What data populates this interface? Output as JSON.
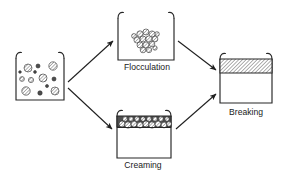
{
  "figure": {
    "name": "emulsion-instability-diagram",
    "type": "process-diagram",
    "background_color": "#ffffff",
    "line_color": "#262626",
    "label_color": "#1a1a1a",
    "width": 290,
    "height": 180
  },
  "stages": [
    {
      "id": "initial",
      "label": "",
      "label_visible": false,
      "beaker": {
        "x": 16,
        "y": 56,
        "width": 48,
        "height": 44
      },
      "content": "dispersed-droplets",
      "droplet_count": 13
    },
    {
      "id": "flocculation",
      "label": "Flocculation",
      "label_visible": true,
      "label_x": 147,
      "label_y": 68,
      "beaker": {
        "x": 118,
        "y": 16,
        "width": 56,
        "height": 44
      },
      "content": "clustered-droplets",
      "droplet_count": 15
    },
    {
      "id": "creaming",
      "label": "Creaming",
      "label_visible": true,
      "label_x": 143,
      "label_y": 166,
      "beaker": {
        "x": 117,
        "y": 114,
        "width": 54,
        "height": 44
      },
      "content": "top-droplet-band",
      "band": {
        "top": 116,
        "height": 11
      },
      "droplet_count": 17
    },
    {
      "id": "breaking",
      "label": "Breaking",
      "label_visible": true,
      "label_x": 246,
      "label_y": 113,
      "beaker": {
        "x": 220,
        "y": 57,
        "width": 52,
        "height": 46
      },
      "content": "hatched-separated-layer",
      "band": {
        "top": 59,
        "height": 14,
        "fill_pattern": "diagonal-hatch"
      }
    }
  ],
  "arrows": [
    {
      "id": "initial-to-flocculation",
      "from": "initial",
      "to": "flocculation",
      "x1": 68,
      "y1": 82,
      "x2": 114,
      "y2": 40
    },
    {
      "id": "initial-to-creaming",
      "from": "initial",
      "to": "creaming",
      "x1": 68,
      "y1": 88,
      "x2": 113,
      "y2": 130
    },
    {
      "id": "flocculation-to-breaking",
      "from": "flocculation",
      "to": "breaking",
      "x1": 178,
      "y1": 40,
      "x2": 217,
      "y2": 70
    },
    {
      "id": "creaming-to-breaking",
      "from": "creaming",
      "to": "breaking",
      "x1": 176,
      "y1": 130,
      "x2": 217,
      "y2": 93
    }
  ],
  "droplet_sets": {
    "initial": [
      {
        "cx": 28,
        "cy": 68,
        "r": 4.0,
        "style": "hatched"
      },
      {
        "cx": 38,
        "cy": 66,
        "r": 2.0,
        "style": "solid"
      },
      {
        "cx": 53,
        "cy": 66,
        "r": 4.2,
        "style": "hatched"
      },
      {
        "cx": 22,
        "cy": 79,
        "r": 2.4,
        "style": "hatched"
      },
      {
        "cx": 31,
        "cy": 80,
        "r": 2.6,
        "style": "hatched"
      },
      {
        "cx": 43,
        "cy": 78,
        "r": 4.0,
        "style": "hatched"
      },
      {
        "cx": 54,
        "cy": 79,
        "r": 2.0,
        "style": "solid"
      },
      {
        "cx": 26,
        "cy": 91,
        "r": 4.2,
        "style": "hatched"
      },
      {
        "cx": 40,
        "cy": 93,
        "r": 2.2,
        "style": "solid"
      },
      {
        "cx": 55,
        "cy": 91,
        "r": 4.0,
        "style": "hatched"
      },
      {
        "cx": 35,
        "cy": 72,
        "r": 1.4,
        "style": "solid"
      },
      {
        "cx": 47,
        "cy": 86,
        "r": 1.5,
        "style": "solid"
      },
      {
        "cx": 20,
        "cy": 72,
        "r": 1.3,
        "style": "solid"
      }
    ],
    "flocculation": [
      {
        "cx": 140,
        "cy": 34,
        "r": 3.2,
        "style": "hatched"
      },
      {
        "cx": 146,
        "cy": 32,
        "r": 3.0,
        "style": "hatched"
      },
      {
        "cx": 152,
        "cy": 34,
        "r": 3.1,
        "style": "hatched"
      },
      {
        "cx": 137,
        "cy": 40,
        "r": 3.1,
        "style": "hatched"
      },
      {
        "cx": 143,
        "cy": 39,
        "r": 3.0,
        "style": "hatched"
      },
      {
        "cx": 149,
        "cy": 39,
        "r": 3.2,
        "style": "hatched"
      },
      {
        "cx": 155,
        "cy": 39,
        "r": 2.9,
        "style": "hatched"
      },
      {
        "cx": 140,
        "cy": 45,
        "r": 3.0,
        "style": "hatched"
      },
      {
        "cx": 146,
        "cy": 45,
        "r": 3.1,
        "style": "hatched"
      },
      {
        "cx": 152,
        "cy": 44,
        "r": 2.8,
        "style": "hatched"
      },
      {
        "cx": 143,
        "cy": 50,
        "r": 2.8,
        "style": "hatched"
      },
      {
        "cx": 149,
        "cy": 50,
        "r": 2.7,
        "style": "hatched"
      },
      {
        "cx": 134,
        "cy": 36,
        "r": 2.4,
        "style": "hatched"
      },
      {
        "cx": 157,
        "cy": 34,
        "r": 2.3,
        "style": "hatched"
      },
      {
        "cx": 155,
        "cy": 48,
        "r": 2.2,
        "style": "hatched"
      }
    ],
    "creaming": [
      {
        "cx": 122,
        "cy": 124,
        "r": 3.0,
        "style": "hatched"
      },
      {
        "cx": 128,
        "cy": 125,
        "r": 3.2,
        "style": "hatched"
      },
      {
        "cx": 134,
        "cy": 124,
        "r": 3.0,
        "style": "hatched"
      },
      {
        "cx": 140,
        "cy": 125,
        "r": 3.1,
        "style": "hatched"
      },
      {
        "cx": 146,
        "cy": 124,
        "r": 3.0,
        "style": "hatched"
      },
      {
        "cx": 152,
        "cy": 125,
        "r": 3.2,
        "style": "hatched"
      },
      {
        "cx": 158,
        "cy": 124,
        "r": 3.0,
        "style": "hatched"
      },
      {
        "cx": 164,
        "cy": 125,
        "r": 2.9,
        "style": "hatched"
      },
      {
        "cx": 169,
        "cy": 124,
        "r": 2.4,
        "style": "hatched"
      },
      {
        "cx": 125,
        "cy": 119,
        "r": 2.4,
        "style": "hatched"
      },
      {
        "cx": 131,
        "cy": 119,
        "r": 2.3,
        "style": "hatched"
      },
      {
        "cx": 137,
        "cy": 119,
        "r": 2.4,
        "style": "hatched"
      },
      {
        "cx": 143,
        "cy": 119,
        "r": 2.3,
        "style": "hatched"
      },
      {
        "cx": 149,
        "cy": 119,
        "r": 2.4,
        "style": "hatched"
      },
      {
        "cx": 155,
        "cy": 119,
        "r": 2.3,
        "style": "hatched"
      },
      {
        "cx": 161,
        "cy": 119,
        "r": 2.4,
        "style": "hatched"
      },
      {
        "cx": 167,
        "cy": 119,
        "r": 2.2,
        "style": "hatched"
      }
    ]
  }
}
